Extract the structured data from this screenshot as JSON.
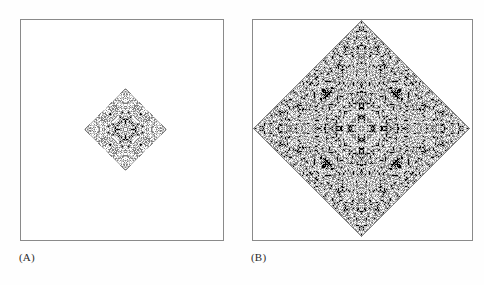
{
  "figure": {
    "background_color": "#ffffff",
    "panel_border_color": "#8a8a8a",
    "label_color": "#2b2b2b"
  },
  "palette": {
    "white": "#ffffff",
    "light_gray": "#c8c8c8",
    "mid_gray": "#808080",
    "dark_gray": "#404040",
    "black": "#000000"
  },
  "panels": [
    {
      "id": "panel-a",
      "label": "(A)",
      "box": {
        "x": 20,
        "y": 19,
        "width": 204,
        "height": 222
      },
      "pattern": {
        "name": "quadratic-cross",
        "type": "totalistic-cellular-automaton",
        "states": 4,
        "neighborhood": "von-neumann",
        "generations": 41,
        "grid_cells": 83,
        "cell_size_px": 1,
        "draw": {
          "x": 84,
          "y": 88,
          "width": 83,
          "height": 83
        },
        "center_cell": [
          41,
          41
        ],
        "seed": "single-cell",
        "symmetry": "4-fold",
        "shape": "cross"
      }
    },
    {
      "id": "panel-b",
      "label": "(B)",
      "box": {
        "x": 252,
        "y": 19,
        "width": 221,
        "height": 222
      },
      "pattern": {
        "name": "quadratic-diamond",
        "type": "totalistic-cellular-automaton",
        "states": 4,
        "neighborhood": "von-neumann",
        "generations": 108,
        "grid_cells": 217,
        "cell_size_px": 1,
        "draw": {
          "x": 253,
          "y": 20,
          "width": 217,
          "height": 217
        },
        "center_cell": [
          108,
          108
        ],
        "seed": "single-cell",
        "symmetry": "4-fold",
        "shape": "diamond"
      }
    }
  ],
  "labels": {
    "a": "(A)",
    "b": "(B)"
  }
}
